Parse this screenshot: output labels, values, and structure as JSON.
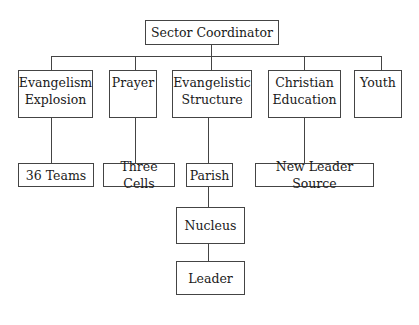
{
  "diagram": {
    "type": "org-chart",
    "root": {
      "id": "sector_coordinator",
      "label": "Sector Coordinator"
    },
    "level1": [
      {
        "id": "evangelism_explosion",
        "line1": "Evangelism",
        "line2": "Explosion"
      },
      {
        "id": "prayer",
        "line1": "Prayer",
        "line2": ""
      },
      {
        "id": "evangelistic_structure",
        "line1": "Evangelistic",
        "line2": "Structure"
      },
      {
        "id": "christian_education",
        "line1": "Christian",
        "line2": "Education"
      },
      {
        "id": "youth",
        "line1": "Youth",
        "line2": ""
      }
    ],
    "level2": [
      {
        "id": "36_teams",
        "label": "36 Teams",
        "parent": "evangelism_explosion"
      },
      {
        "id": "three_cells",
        "label": "Three Cells",
        "parent": "prayer"
      },
      {
        "id": "parish",
        "label": "Parish",
        "parent": "evangelistic_structure"
      },
      {
        "id": "new_leader_source",
        "label": "New Leader Source",
        "parent": "christian_education"
      }
    ],
    "level3": [
      {
        "id": "nucleus",
        "label": "Nucleus",
        "parent": "parish"
      }
    ],
    "level4": [
      {
        "id": "leader",
        "label": "Leader",
        "parent": "nucleus"
      }
    ]
  }
}
